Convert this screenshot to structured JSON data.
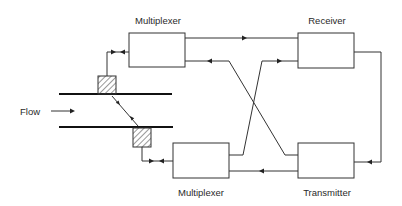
{
  "diagram": {
    "type": "block-diagram",
    "flow_label": "Flow",
    "blocks": [
      {
        "id": "mux-top",
        "label": "Multiplexer"
      },
      {
        "id": "receiver",
        "label": "Receiver"
      },
      {
        "id": "mux-bottom",
        "label": "Multiplexer"
      },
      {
        "id": "transmitter",
        "label": "Transmitter"
      }
    ],
    "transducers": [
      {
        "id": "transducer-upstream",
        "position": "top of pipe"
      },
      {
        "id": "transducer-downstream",
        "position": "bottom of pipe"
      }
    ],
    "connections": [
      {
        "from": "mux-top",
        "to": "receiver",
        "direction": "right"
      },
      {
        "from": "receiver",
        "to": "transmitter",
        "direction": "down"
      },
      {
        "from": "transmitter",
        "to": "mux-bottom",
        "direction": "left"
      },
      {
        "from": "transmitter",
        "to": "mux-top",
        "direction": "left",
        "crossing": true
      },
      {
        "from": "mux-bottom",
        "to": "receiver",
        "direction": "right",
        "crossing": true
      },
      {
        "from": "mux-top",
        "to": "transducer-upstream",
        "direction": "bidirectional"
      },
      {
        "from": "mux-bottom",
        "to": "transducer-downstream",
        "direction": "bidirectional"
      },
      {
        "from": "transducer-upstream",
        "to": "transducer-downstream",
        "direction": "bidirectional",
        "medium": "acoustic path through flow"
      }
    ]
  }
}
